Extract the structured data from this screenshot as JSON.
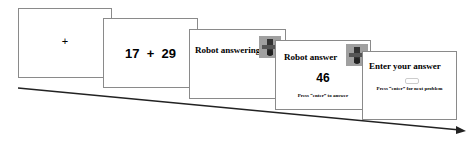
{
  "screens": [
    {
      "symbol": "+"
    },
    {
      "problem": "17  +  29"
    },
    {
      "title": "Robot answering",
      "image": "robot-icon"
    },
    {
      "title": "Robot answer",
      "answer": "46",
      "instruction": "Press “enter” to answer",
      "image": "robot-icon"
    },
    {
      "title": "Enter your answer",
      "instruction": "Press “enter” for next problem"
    }
  ],
  "arrow": {
    "label": "time",
    "color": "#222222"
  }
}
